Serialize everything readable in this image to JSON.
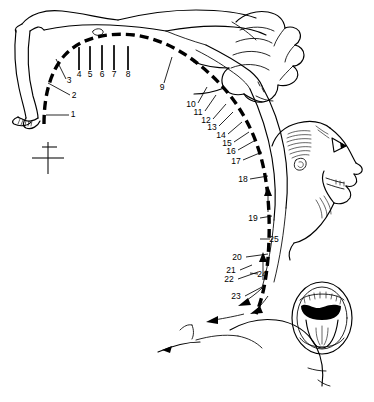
{
  "figure": {
    "caption": "",
    "background_color": "#ffffff",
    "ink_color": "#000000",
    "width": 374,
    "height": 402
  },
  "registration_mark": {
    "name": "crop-registration-cross",
    "x": 48,
    "y": 158
  },
  "insets": {
    "open_mouth": {
      "name": "open-mouth-inset",
      "description": "frontal view of open mouth showing teeth and tongue",
      "cx": 322,
      "cy": 318
    },
    "fist": {
      "name": "clenched-fist",
      "description": "clenched hand with flexed fingers",
      "cx": 275,
      "cy": 55
    },
    "head_profile": {
      "name": "head-profile",
      "description": "head in profile, hyperextended with open mouth",
      "cx": 305,
      "cy": 175
    }
  },
  "labels": [
    {
      "id": "1",
      "text": "1",
      "tx": 73,
      "ty": 115,
      "lx1": 69,
      "ly1": 115,
      "lx2": 46,
      "ly2": 115
    },
    {
      "id": "2",
      "text": "2",
      "tx": 74,
      "ty": 96,
      "lx1": 70,
      "ly1": 95,
      "lx2": 48,
      "ly2": 83
    },
    {
      "id": "3",
      "text": "3",
      "tx": 69,
      "ty": 81,
      "lx1": 66,
      "ly1": 79,
      "lx2": 56,
      "ly2": 59
    },
    {
      "id": "4",
      "text": "4",
      "tx": 79,
      "ty": 75,
      "lx1": 79,
      "ly1": 70,
      "lx2": 79,
      "ly2": 48
    },
    {
      "id": "5",
      "text": "5",
      "tx": 90,
      "ty": 75,
      "lx1": 90,
      "ly1": 70,
      "lx2": 90,
      "ly2": 47
    },
    {
      "id": "6",
      "text": "6",
      "tx": 102,
      "ty": 75,
      "lx1": 102,
      "ly1": 70,
      "lx2": 102,
      "ly2": 46
    },
    {
      "id": "7",
      "text": "7",
      "tx": 114,
      "ty": 75,
      "lx1": 114,
      "ly1": 70,
      "lx2": 114,
      "ly2": 46
    },
    {
      "id": "8",
      "text": "8",
      "tx": 128,
      "ty": 75,
      "lx1": 128,
      "ly1": 70,
      "lx2": 128,
      "ly2": 47
    },
    {
      "id": "9",
      "text": "9",
      "tx": 162,
      "ty": 88,
      "lx1": 164,
      "ly1": 83,
      "lx2": 172,
      "ly2": 57
    },
    {
      "id": "10",
      "text": "10",
      "tx": 191,
      "ty": 105,
      "lx1": 198,
      "ly1": 103,
      "lx2": 207,
      "ly2": 87
    },
    {
      "id": "11",
      "text": "11",
      "tx": 198,
      "ty": 113,
      "lx1": 205,
      "ly1": 111,
      "lx2": 216,
      "ly2": 95
    },
    {
      "id": "12",
      "text": "12",
      "tx": 206,
      "ty": 121,
      "lx1": 213,
      "ly1": 119,
      "lx2": 226,
      "ly2": 104
    },
    {
      "id": "13",
      "text": "13",
      "tx": 212,
      "ty": 128,
      "lx1": 219,
      "ly1": 126,
      "lx2": 233,
      "ly2": 112
    },
    {
      "id": "14",
      "text": "14",
      "tx": 221,
      "ty": 136,
      "lx1": 228,
      "ly1": 134,
      "lx2": 242,
      "ly2": 122
    },
    {
      "id": "15",
      "text": "15",
      "tx": 227,
      "ty": 144,
      "lx1": 234,
      "ly1": 142,
      "lx2": 249,
      "ly2": 132
    },
    {
      "id": "16",
      "text": "16",
      "tx": 231,
      "ty": 152,
      "lx1": 238,
      "ly1": 150,
      "lx2": 254,
      "ly2": 141
    },
    {
      "id": "17",
      "text": "17",
      "tx": 236,
      "ty": 162,
      "lx1": 243,
      "ly1": 160,
      "lx2": 262,
      "ly2": 152
    },
    {
      "id": "18",
      "text": "18",
      "tx": 243,
      "ty": 180,
      "lx1": 250,
      "ly1": 179,
      "lx2": 268,
      "ly2": 176
    },
    {
      "id": "19",
      "text": "19",
      "tx": 253,
      "ty": 219,
      "lx1": 260,
      "ly1": 218,
      "lx2": 272,
      "ly2": 216
    },
    {
      "id": "20",
      "text": "20",
      "tx": 237,
      "ty": 258,
      "lx1": 246,
      "ly1": 257,
      "lx2": 268,
      "ly2": 254
    },
    {
      "id": "21",
      "text": "21",
      "tx": 231,
      "ty": 271,
      "lx1": 240,
      "ly1": 270,
      "lx2": 252,
      "ly2": 265
    },
    {
      "id": "22",
      "text": "22",
      "tx": 229,
      "ty": 280,
      "lx1": 238,
      "ly1": 279,
      "lx2": 258,
      "ly2": 272
    },
    {
      "id": "23",
      "text": "23",
      "tx": 236,
      "ty": 297,
      "lx1": 245,
      "ly1": 296,
      "lx2": 262,
      "ly2": 287
    },
    {
      "id": "24",
      "text": "24",
      "tx": 262,
      "ty": 275,
      "lx1": 258,
      "ly1": 274,
      "lx2": 250,
      "ly2": 273
    },
    {
      "id": "25",
      "text": "25",
      "tx": 274,
      "ty": 240,
      "lx1": 270,
      "ly1": 239,
      "lx2": 260,
      "ly2": 239
    }
  ],
  "ticks_upper": [
    {
      "x": 79,
      "y1": 47,
      "y2": 70
    },
    {
      "x": 90,
      "y1": 46,
      "y2": 70
    },
    {
      "x": 102,
      "y1": 45,
      "y2": 70
    },
    {
      "x": 114,
      "y1": 45,
      "y2": 70
    },
    {
      "x": 128,
      "y1": 46,
      "y2": 70
    }
  ],
  "arrows": [
    {
      "name": "arrow-neck-up",
      "x": 268,
      "y": 200,
      "dir": "up"
    },
    {
      "name": "arrow-lumbar-up",
      "x": 263,
      "y": 268,
      "dir": "up"
    },
    {
      "name": "arrow-sacral-left",
      "x": 215,
      "y": 318,
      "dir": "left"
    },
    {
      "name": "arrow-gluteal",
      "x": 245,
      "y": 300,
      "dir": "down-left"
    }
  ]
}
